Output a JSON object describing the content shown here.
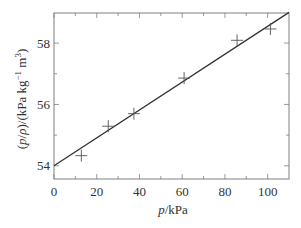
{
  "chart_data": {
    "type": "scatter",
    "title": "",
    "xlabel": "p/kPa",
    "ylabel": "(p/ρ)/(kPa kg⁻¹ m³)",
    "xlim": [
      0,
      110
    ],
    "ylim": [
      53.57,
      58.98
    ],
    "x_ticks": [
      0,
      20,
      40,
      60,
      80,
      100
    ],
    "x_minor_ticks": [
      10,
      30,
      50,
      70,
      90
    ],
    "y_ticks": [
      54,
      56,
      58
    ],
    "y_minor_ticks": [
      55,
      57
    ],
    "grid": false,
    "legend": null,
    "series": [
      {
        "name": "measurements",
        "marker": "+",
        "x": [
          12.8,
          25.4,
          37.4,
          60.9,
          85.7,
          101.3
        ],
        "y": [
          54.33,
          55.29,
          55.7,
          56.86,
          58.09,
          58.46
        ]
      },
      {
        "name": "linear fit",
        "style": "line",
        "x": [
          0,
          110
        ],
        "y": [
          54.0,
          59.0
        ]
      }
    ]
  },
  "axes": {
    "x_label_var": "p",
    "x_label_unit": "/kPa",
    "y_label_text": "(p/ρ)/(kPa kg",
    "y_label_exp1": "−1",
    "y_label_mid": " m",
    "y_label_exp2": "3",
    "y_label_end": ")"
  },
  "colors": {
    "frame": "#808080",
    "fit_line": "#333333",
    "marker": "#555555",
    "text": "#333333"
  }
}
